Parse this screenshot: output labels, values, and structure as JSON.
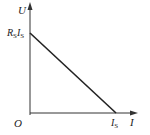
{
  "diagram": {
    "type": "U-I characteristic line",
    "y_axis": {
      "label": "U"
    },
    "x_axis": {
      "label": "I"
    },
    "origin_label": "O",
    "y_intercept": {
      "main": "R",
      "main_sub": "S",
      "second": "I",
      "second_sub": "S"
    },
    "x_intercept": {
      "main": "I",
      "main_sub": "S"
    },
    "colors": {
      "axis": "#333333",
      "line": "#222222",
      "text": "#222222"
    }
  }
}
